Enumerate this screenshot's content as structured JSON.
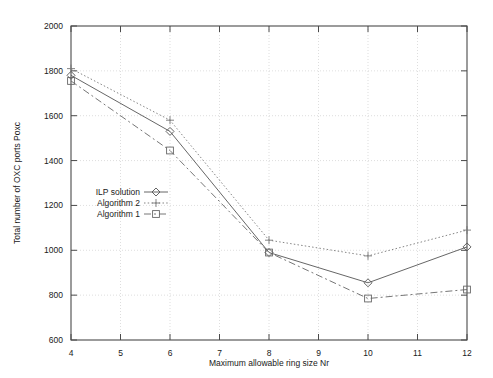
{
  "chart_data": {
    "type": "line",
    "title": "",
    "xlabel": "Maximum allowable ring size Nr",
    "ylabel": "Total number of OXC ports Poxc",
    "x": [
      4,
      6,
      8,
      10,
      12
    ],
    "xlim": [
      4,
      12
    ],
    "ylim": [
      600,
      2000
    ],
    "xticks": [
      4,
      5,
      6,
      7,
      8,
      9,
      10,
      11,
      12
    ],
    "yticks": [
      600,
      800,
      1000,
      1200,
      1400,
      1600,
      1800,
      2000
    ],
    "xticklabels": [
      "4",
      "5",
      "6",
      "7",
      "8",
      "9",
      "10",
      "11",
      "12"
    ],
    "yticklabels": [
      "600",
      "800",
      "1000",
      "1200",
      "1400",
      "1600",
      "1800",
      "2000"
    ],
    "grid": true,
    "legend_position": "center-left",
    "series": [
      {
        "name": "ILP solution",
        "marker": "diamond",
        "linestyle": "solid",
        "color": "#555555",
        "x": [
          4,
          6,
          8,
          10,
          12
        ],
        "values": [
          1780,
          1530,
          990,
          855,
          1015
        ]
      },
      {
        "name": "Algorithm 2",
        "marker": "plus",
        "linestyle": "dotted",
        "color": "#777777",
        "x": [
          4,
          6,
          8,
          10,
          12
        ],
        "values": [
          1810,
          1580,
          1045,
          975,
          1090
        ]
      },
      {
        "name": "Algorithm 1",
        "marker": "square",
        "linestyle": "dashed",
        "color": "#666666",
        "x": [
          4,
          6,
          8,
          10,
          12
        ],
        "values": [
          1755,
          1445,
          990,
          785,
          825
        ]
      }
    ]
  },
  "axes": {
    "y_axis_label": "Total number of OXC ports Poxc",
    "x_axis_label": "Maximum allowable ring size Nr",
    "y_tick_0": "600",
    "y_tick_1": "800",
    "y_tick_2": "1000",
    "y_tick_3": "1200",
    "y_tick_4": "1400",
    "y_tick_5": "1600",
    "y_tick_6": "1800",
    "y_tick_7": "2000",
    "x_tick_0": "4",
    "x_tick_1": "5",
    "x_tick_2": "6",
    "x_tick_3": "7",
    "x_tick_4": "8",
    "x_tick_5": "9",
    "x_tick_6": "10",
    "x_tick_7": "11",
    "x_tick_8": "12"
  },
  "legend": {
    "entries": [
      {
        "label": "ILP solution"
      },
      {
        "label": "Algorithm 2"
      },
      {
        "label": "Algorithm 1"
      }
    ]
  }
}
